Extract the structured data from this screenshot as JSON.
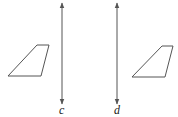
{
  "diagram": {
    "colors": {
      "stroke": "#555555",
      "background": "#ffffff",
      "text": "#222222"
    },
    "lines": [
      {
        "id": "c",
        "label": "c",
        "x": 62,
        "y1": 2,
        "y2": 105
      },
      {
        "id": "d",
        "label": "d",
        "x": 117,
        "y1": 2,
        "y2": 105
      }
    ],
    "shapes": [
      {
        "id": "left-trapezoid",
        "points": "8,76 37,45 49,45 41,76"
      },
      {
        "id": "right-trapezoid",
        "points": "132,77 162,46 173,46 165,77"
      }
    ]
  }
}
